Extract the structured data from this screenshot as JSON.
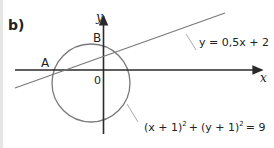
{
  "part_label": "b)",
  "axes": {
    "x_label": "x",
    "y_label": "y",
    "origin_label": "0"
  },
  "points": [
    {
      "name": "A",
      "label": "A"
    },
    {
      "name": "B",
      "label": "B"
    }
  ],
  "line": {
    "equation": "y = 0,5x + 2"
  },
  "circle": {
    "equation_parts": {
      "a": "(x + 1)",
      "b": "(y + 1)",
      "exp": "2",
      "plus": "+",
      "rhs": "= 9"
    }
  },
  "colors": {
    "axis": "#2a2a2a",
    "curve": "#7a7a7a",
    "leader": "#9a9a9a",
    "text": "#222222"
  }
}
